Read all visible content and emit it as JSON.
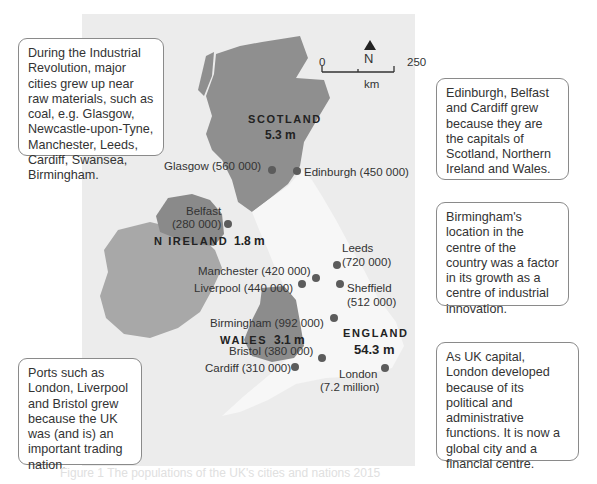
{
  "boxes": {
    "industrial": "During the Industrial Revolution, major cities grew up near raw materials, such as coal, e.g. Glasgow, Newcastle-upon-Tyne, Manchester, Leeds, Cardiff, Swansea, Birmingham.",
    "capitals": "Edinburgh, Belfast and Cardiff grew because they are the capitals of Scotland, Northern Ireland and Wales.",
    "birmingham": "Birmingham's location in the centre of the country was a factor in its growth as a centre of industrial innovation.",
    "ports": "Ports such as London, Liverpool and Bristol grew because the UK was (and is) an important trading nation.",
    "london": "As UK capital, London developed because of its political and administrative functions. It is now a global city and a financial centre."
  },
  "scale": {
    "north": "N",
    "zero": "0",
    "max": "250",
    "unit": "km"
  },
  "nations": {
    "scotland": {
      "name": "SCOTLAND",
      "pop": "5.3 m"
    },
    "nireland": {
      "name": "N IRELAND",
      "pop": "1.8 m"
    },
    "wales": {
      "name": "WALES",
      "pop": "3.1 m"
    },
    "england": {
      "name": "ENGLAND",
      "pop": "54.3 m"
    }
  },
  "cities": {
    "glasgow": "Glasgow (560 000)",
    "edinburgh": "Edinburgh (450 000)",
    "belfast_name": "Belfast",
    "belfast_pop": "(280 000)",
    "leeds_name": "Leeds",
    "leeds_pop": "(720 000)",
    "manchester": "Manchester (420 000)",
    "liverpool": "Liverpool (440 000)",
    "sheffield_name": "Sheffield",
    "sheffield_pop": "(512 000)",
    "birmingham": "Birmingham (992 000)",
    "bristol": "Bristol (380 000)",
    "cardiff": "Cardiff (310 000)",
    "london_name": "London",
    "london_pop": "(7.2 million)"
  },
  "caption": "Figure 1 The populations of the UK's cities and nations 2015",
  "colors": {
    "scotland": "#8f8f8f",
    "nireland": "#8a8a8a",
    "ireland": "#a8a8a8",
    "wales": "#8c8c8c",
    "england": "#f7f7f7",
    "sea": "#ececec"
  }
}
